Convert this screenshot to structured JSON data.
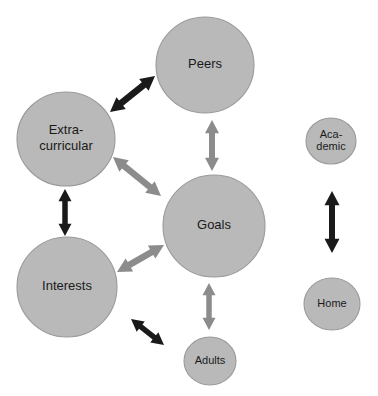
{
  "diagram": {
    "background_color": "#ffffff",
    "node_fill_color": "#b9b9b9",
    "node_stroke_color": "#9a9a9a",
    "label_color": "#1a1a1a",
    "arrow_colors": {
      "black": "#1a1a1a",
      "gray": "#8c8c8c"
    },
    "nodes": [
      {
        "id": "peers",
        "label": "Peers",
        "lines": [
          "Peers"
        ],
        "cx": 205,
        "cy": 65,
        "rx": 49,
        "ry": 48,
        "font_size": 13
      },
      {
        "id": "extracurricular",
        "label": "Extra-curricular",
        "lines": [
          "Extra-",
          "curricular"
        ],
        "cx": 66,
        "cy": 139,
        "rx": 49,
        "ry": 47,
        "font_size": 13
      },
      {
        "id": "goals",
        "label": "Goals",
        "lines": [
          "Goals"
        ],
        "cx": 214,
        "cy": 226,
        "rx": 51,
        "ry": 51,
        "font_size": 13
      },
      {
        "id": "interests",
        "label": "Interests",
        "lines": [
          "Interests"
        ],
        "cx": 67,
        "cy": 287,
        "rx": 50,
        "ry": 50,
        "font_size": 13
      },
      {
        "id": "adults",
        "label": "Adults",
        "lines": [
          "Adults"
        ],
        "cx": 210,
        "cy": 361,
        "rx": 26,
        "ry": 24,
        "font_size": 11
      },
      {
        "id": "academic",
        "label": "Academic",
        "lines": [
          "Aca-",
          "demic"
        ],
        "cx": 331,
        "cy": 141,
        "rx": 25,
        "ry": 23,
        "font_size": 11
      },
      {
        "id": "home",
        "label": "Home",
        "lines": [
          "Home"
        ],
        "cx": 332,
        "cy": 304,
        "rx": 28,
        "ry": 26,
        "font_size": 11
      }
    ],
    "connections": [
      {
        "id": "extracurricular-peers",
        "from": "extracurricular",
        "to": "peers",
        "color": "black",
        "style": "double-headed",
        "x1": 110,
        "y1": 112,
        "x2": 155,
        "y2": 76,
        "thickness": 6.5,
        "head": 7.5
      },
      {
        "id": "peers-goals",
        "from": "peers",
        "to": "goals",
        "color": "gray",
        "style": "double-headed",
        "x1": 212,
        "y1": 120,
        "x2": 212,
        "y2": 171,
        "thickness": 6,
        "head": 7
      },
      {
        "id": "extracurricular-goals",
        "from": "extracurricular",
        "to": "goals",
        "color": "gray",
        "style": "double-headed",
        "x1": 113,
        "y1": 157,
        "x2": 161,
        "y2": 196,
        "thickness": 6.5,
        "head": 7.5
      },
      {
        "id": "extracurricular-interests",
        "from": "extracurricular",
        "to": "interests",
        "color": "black",
        "style": "double-headed",
        "x1": 65,
        "y1": 189,
        "x2": 65,
        "y2": 236,
        "thickness": 5.5,
        "head": 6.5
      },
      {
        "id": "interests-goals",
        "from": "interests",
        "to": "goals",
        "color": "gray",
        "style": "double-headed",
        "x1": 117,
        "y1": 272,
        "x2": 164,
        "y2": 245,
        "thickness": 6.5,
        "head": 7.5
      },
      {
        "id": "goals-adults",
        "from": "goals",
        "to": "adults",
        "color": "gray",
        "style": "double-headed",
        "x1": 209,
        "y1": 283,
        "x2": 209,
        "y2": 330,
        "thickness": 5.5,
        "head": 6.5
      },
      {
        "id": "interests-adults",
        "from": "interests",
        "to": "adults",
        "color": "black",
        "style": "double-headed",
        "x1": 131,
        "y1": 319,
        "x2": 164,
        "y2": 345,
        "thickness": 5.5,
        "head": 6.5
      },
      {
        "id": "academic-home",
        "from": "academic",
        "to": "home",
        "color": "black",
        "style": "double-headed",
        "x1": 332,
        "y1": 191,
        "x2": 332,
        "y2": 253,
        "thickness": 6,
        "head": 7.5
      }
    ]
  }
}
